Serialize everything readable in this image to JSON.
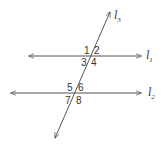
{
  "diagram": {
    "type": "parallel lines cut by a transversal",
    "colors": {
      "line": "#555555",
      "text": "#333333",
      "background": "#ffffff"
    },
    "lines": [
      {
        "id": "l1",
        "label": "l",
        "subscript": "1"
      },
      {
        "id": "l2",
        "label": "l",
        "subscript": "2"
      },
      {
        "id": "l3",
        "label": "l",
        "subscript": "3"
      }
    ],
    "angles": {
      "a1": "1",
      "a2": "2",
      "a3": "3",
      "a4": "4",
      "a5": "5",
      "a6": "6",
      "a7": "7",
      "a8": "8"
    }
  }
}
